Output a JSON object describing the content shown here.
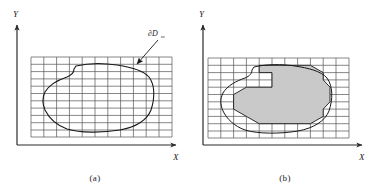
{
  "figure": {
    "panels": [
      {
        "id": "a",
        "caption": "(a)",
        "axis": {
          "x_label": "X",
          "y_label": "Y"
        },
        "annotation": {
          "symbol": "∂D",
          "subscript": "m",
          "icon": "arrow-pointer-icon"
        },
        "grid": {
          "columns": 11,
          "rows": 11,
          "line_color": "#555555"
        },
        "region": {
          "fill": "none",
          "stroke": "#1a1a1a",
          "label": "smooth-domain-boundary"
        }
      },
      {
        "id": "b",
        "caption": "(b)",
        "axis": {
          "x_label": "X",
          "y_label": "Y"
        },
        "grid": {
          "columns": 11,
          "rows": 11,
          "line_color": "#555555"
        },
        "region": {
          "fill": "#c9c9c9",
          "stroke": "#1a1a1a",
          "label": "grid-cell-approximation"
        }
      }
    ],
    "colors": {
      "axis": "#2b2b2b",
      "grid": "#555555",
      "curve": "#1a1a1a",
      "shade": "#c9c9c9",
      "background": "#ffffff"
    }
  }
}
